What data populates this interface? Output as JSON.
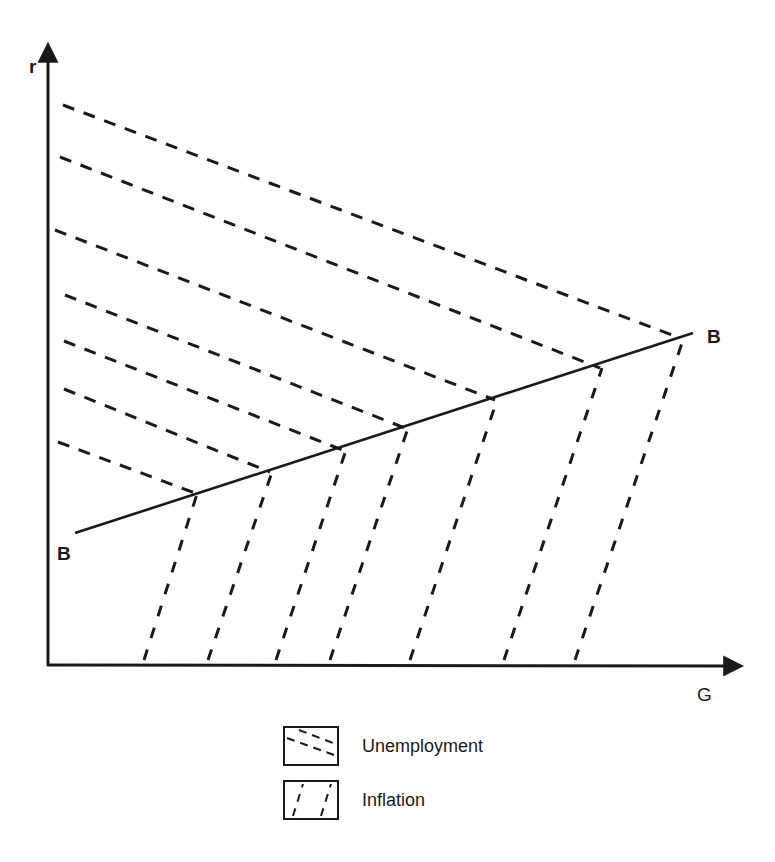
{
  "axes": {
    "y_label": "r",
    "x_label": "G"
  },
  "curve": {
    "name": "BB",
    "start_label": "B",
    "end_label": "B",
    "start": [
      75,
      533
    ],
    "end": [
      693,
      333
    ]
  },
  "regions": {
    "unemployment": {
      "description": "dashed lines sloping downward to BB (above/left of BB)",
      "lines": [
        [
          [
            63,
            105
          ],
          [
            680,
            338
          ]
        ],
        [
          [
            60,
            157
          ],
          [
            600,
            368
          ]
        ],
        [
          [
            55,
            230
          ],
          [
            495,
            400
          ]
        ],
        [
          [
            65,
            295
          ],
          [
            405,
            428
          ]
        ],
        [
          [
            64,
            341
          ],
          [
            345,
            451
          ]
        ],
        [
          [
            64,
            389
          ],
          [
            270,
            472
          ]
        ],
        [
          [
            58,
            442
          ],
          [
            195,
            493
          ]
        ]
      ]
    },
    "inflation": {
      "description": "dashed lines sloping upward from G axis to BB (below/right of BB)",
      "lines": [
        [
          [
            144,
            660
          ],
          [
            197,
            494
          ]
        ],
        [
          [
            208,
            660
          ],
          [
            272,
            472
          ]
        ],
        [
          [
            276,
            660
          ],
          [
            346,
            450
          ]
        ],
        [
          [
            330,
            660
          ],
          [
            408,
            428
          ]
        ],
        [
          [
            410,
            660
          ],
          [
            497,
            400
          ]
        ],
        [
          [
            504,
            660
          ],
          [
            602,
            368
          ]
        ],
        [
          [
            575,
            660
          ],
          [
            684,
            337
          ]
        ]
      ]
    }
  },
  "legend": {
    "items": [
      {
        "label": "Unemployment",
        "pattern": "downward-dash"
      },
      {
        "label": "Inflation",
        "pattern": "upward-dash"
      }
    ]
  },
  "colors": {
    "ink": "#1a1a1a",
    "background": "#ffffff"
  }
}
